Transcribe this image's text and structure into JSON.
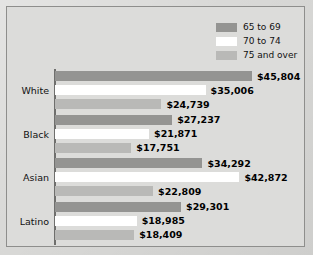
{
  "chart_data": {
    "type": "bar",
    "orientation": "horizontal",
    "title": "",
    "xlabel": "",
    "ylabel": "",
    "categories": [
      "White",
      "Black",
      "Asian",
      "Latino"
    ],
    "series": [
      {
        "name": "65 to 69",
        "color": "#949492",
        "values": [
          45804,
          27237,
          34292,
          29301
        ],
        "labels": [
          "$45,804",
          "$27,237",
          "$34,292",
          "$29,301"
        ]
      },
      {
        "name": "70 to 74",
        "color": "#ffffff",
        "values": [
          35006,
          21871,
          42872,
          18985
        ],
        "labels": [
          "$35,006",
          "$21,871",
          "$42,872",
          "$18,985"
        ]
      },
      {
        "name": "75 and over",
        "color": "#b9b9b7",
        "values": [
          24739,
          17751,
          22809,
          18409
        ],
        "labels": [
          "$24,739",
          "$17,751",
          "$22,809",
          "$18,409"
        ]
      }
    ],
    "xlim": [
      0,
      45804
    ],
    "grid": false,
    "legend_position": "top-right",
    "value_prefix": "$"
  },
  "legend": {
    "items": [
      {
        "label": "65 to 69",
        "swatch": "#949492"
      },
      {
        "label": "70 to 74",
        "swatch": "#ffffff"
      },
      {
        "label": "75 and over",
        "swatch": "#b9b9b7"
      }
    ]
  },
  "colors": {
    "page_background": "#d9d9d7",
    "frame_background": "#dcdcda",
    "frame_border": "#8e8e8c",
    "axis_line": "#6f6f6d",
    "label_text": "#000000"
  }
}
